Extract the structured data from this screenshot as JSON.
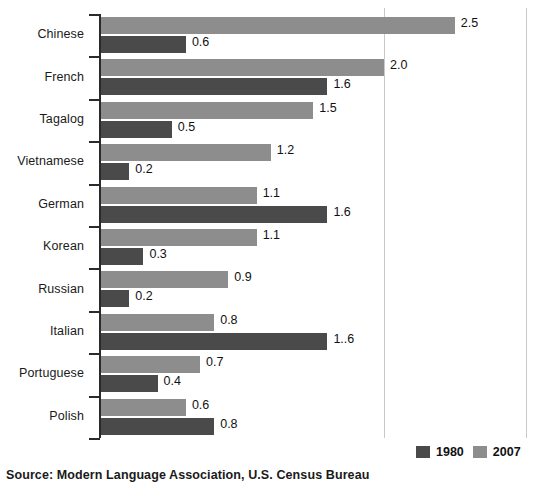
{
  "chart_data": {
    "type": "bar",
    "orientation": "horizontal",
    "title": "",
    "subtitle": "",
    "xlabel": "",
    "ylabel": "",
    "xlim": [
      0,
      3.0
    ],
    "grid": true,
    "gridlines": [
      2.0,
      3.0
    ],
    "legend_position": "bottom-right",
    "categories": [
      "Chinese",
      "French",
      "Tagalog",
      "Vietnamese",
      "German",
      "Korean",
      "Russian",
      "Italian",
      "Portuguese",
      "Polish"
    ],
    "series": [
      {
        "name": "2007",
        "color": "#8d8d8d",
        "values": [
          2.5,
          2.0,
          1.5,
          1.2,
          1.1,
          1.1,
          0.9,
          0.8,
          0.7,
          0.6
        ],
        "labels": [
          "2.5",
          "2.0",
          "1.5",
          "1.2",
          "1.1",
          "1.1",
          "0.9",
          "0.8",
          "0.7",
          "0.6"
        ]
      },
      {
        "name": "1980",
        "color": "#4a4a4a",
        "values": [
          0.6,
          1.6,
          0.5,
          0.2,
          1.6,
          0.3,
          0.2,
          1.6,
          0.4,
          0.8
        ],
        "labels": [
          "0.6",
          "1.6",
          "0.5",
          "0.2",
          "1.6",
          "0.3",
          "0.2",
          "1..6",
          "0.4",
          "0.8"
        ]
      }
    ]
  },
  "legend": {
    "items": [
      {
        "label": "1980",
        "key": "y1980"
      },
      {
        "label": "2007",
        "key": "y2007"
      }
    ]
  },
  "footer": {
    "source": "Source: Modern Language Association, U.S. Census Bureau"
  }
}
